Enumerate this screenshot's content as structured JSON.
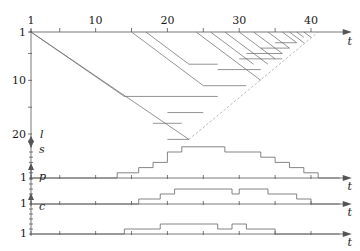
{
  "figure": {
    "title": "",
    "type": "multi-panel-timeline"
  },
  "main_panel": {
    "x_axis": {
      "label": "t",
      "tick_labels": [
        "1",
        "10",
        "20",
        "30",
        "40"
      ],
      "tick_values": [
        1,
        10,
        20,
        30,
        40
      ],
      "minor_tick_values": [
        1,
        5,
        10,
        15,
        20,
        25,
        30,
        35,
        40
      ],
      "range": [
        0,
        44
      ],
      "position": "top",
      "direction": "right"
    },
    "y_axis": {
      "label": "l",
      "tick_labels": [
        "1",
        "10",
        "20"
      ],
      "tick_values": [
        1,
        10,
        20
      ],
      "minor_tick_values": [
        1,
        5,
        10,
        15,
        20
      ],
      "range": [
        0,
        21
      ],
      "direction": "down"
    }
  },
  "sub_panels": [
    {
      "label": "s",
      "x_label": "t",
      "y_tick_label": "1"
    },
    {
      "label": "p",
      "x_label": "t",
      "y_tick_label": "1"
    },
    {
      "label": "c",
      "x_label": "t",
      "y_tick_label": "1"
    }
  ],
  "colors": {
    "axis": "#555555",
    "line": "#666666",
    "dashed": "#999999",
    "text": "#1a1a1a"
  },
  "chart_data": {
    "type": "line",
    "title": "",
    "xlabel": "t",
    "ylabel": "l",
    "xlim": [
      0,
      44
    ],
    "ylim": [
      0,
      21
    ],
    "grid": false,
    "legend": "none",
    "main_diagonals_down": [
      {
        "t0": 1,
        "l0": 1,
        "t1": 23,
        "l1": 21
      },
      {
        "t0": 1,
        "l0": 1,
        "t1": 14,
        "l1": 13
      },
      {
        "t0": 15,
        "l0": 1,
        "t1": 25,
        "l1": 11
      },
      {
        "t0": 17,
        "l0": 1,
        "t1": 23,
        "l1": 7
      },
      {
        "t0": 24,
        "l0": 1,
        "t1": 33,
        "l1": 10
      },
      {
        "t0": 26,
        "l0": 1,
        "t1": 32,
        "l1": 7
      },
      {
        "t0": 28,
        "l0": 1,
        "t1": 34,
        "l1": 7
      },
      {
        "t0": 30,
        "l0": 1,
        "t1": 35,
        "l1": 6
      },
      {
        "t0": 32,
        "l0": 1,
        "t1": 36,
        "l1": 5
      },
      {
        "t0": 34,
        "l0": 1,
        "t1": 37,
        "l1": 4
      },
      {
        "t0": 36,
        "l0": 1,
        "t1": 38,
        "l1": 3
      },
      {
        "t0": 37,
        "l0": 1,
        "t1": 39,
        "l1": 3
      },
      {
        "t0": 38,
        "l0": 1,
        "t1": 39,
        "l1": 2
      },
      {
        "t0": 39,
        "l0": 1,
        "t1": 40,
        "l1": 2
      }
    ],
    "envelope_dashed": [
      {
        "t0": 23,
        "l0": 21,
        "t1": 41,
        "l1": 1
      }
    ],
    "horizontal_segments": [
      {
        "l": 13,
        "t0": 14,
        "t1": 27
      },
      {
        "l": 21,
        "t0": 20,
        "t1": 23
      },
      {
        "l": 18,
        "t0": 18,
        "t1": 22
      },
      {
        "l": 16,
        "t0": 20,
        "t1": 25
      },
      {
        "l": 11,
        "t0": 25,
        "t1": 31
      },
      {
        "l": 8,
        "t0": 27,
        "t1": 33
      },
      {
        "l": 7,
        "t0": 23,
        "t1": 27
      },
      {
        "l": 6,
        "t0": 30,
        "t1": 36
      },
      {
        "l": 5,
        "t0": 31,
        "t1": 36
      },
      {
        "l": 4,
        "t0": 33,
        "t1": 37
      },
      {
        "l": 3,
        "t0": 35,
        "t1": 38
      }
    ],
    "panel_s": {
      "name": "s",
      "steps": [
        {
          "t": 1,
          "v": 0
        },
        {
          "t": 13,
          "v": 0
        },
        {
          "t": 13,
          "v": 1
        },
        {
          "t": 16,
          "v": 1
        },
        {
          "t": 16,
          "v": 2
        },
        {
          "t": 18,
          "v": 2
        },
        {
          "t": 18,
          "v": 3
        },
        {
          "t": 20,
          "v": 3
        },
        {
          "t": 20,
          "v": 5
        },
        {
          "t": 22,
          "v": 5
        },
        {
          "t": 22,
          "v": 6
        },
        {
          "t": 28,
          "v": 6
        },
        {
          "t": 28,
          "v": 5
        },
        {
          "t": 33,
          "v": 5
        },
        {
          "t": 33,
          "v": 4
        },
        {
          "t": 35,
          "v": 4
        },
        {
          "t": 35,
          "v": 3
        },
        {
          "t": 37,
          "v": 3
        },
        {
          "t": 37,
          "v": 2
        },
        {
          "t": 39,
          "v": 2
        },
        {
          "t": 39,
          "v": 1
        },
        {
          "t": 41,
          "v": 1
        },
        {
          "t": 41,
          "v": 0
        },
        {
          "t": 44,
          "v": 0
        }
      ]
    },
    "panel_p": {
      "name": "p",
      "steps": [
        {
          "t": 1,
          "v": 0
        },
        {
          "t": 16,
          "v": 0
        },
        {
          "t": 16,
          "v": 1
        },
        {
          "t": 19,
          "v": 1
        },
        {
          "t": 19,
          "v": 2
        },
        {
          "t": 21,
          "v": 2
        },
        {
          "t": 21,
          "v": 3
        },
        {
          "t": 29,
          "v": 3
        },
        {
          "t": 29,
          "v": 2
        },
        {
          "t": 30,
          "v": 2
        },
        {
          "t": 30,
          "v": 3
        },
        {
          "t": 34,
          "v": 3
        },
        {
          "t": 34,
          "v": 2
        },
        {
          "t": 38,
          "v": 2
        },
        {
          "t": 38,
          "v": 1
        },
        {
          "t": 40,
          "v": 1
        },
        {
          "t": 40,
          "v": 0
        },
        {
          "t": 44,
          "v": 0
        }
      ]
    },
    "panel_c": {
      "name": "c",
      "steps": [
        {
          "t": 1,
          "v": 0
        },
        {
          "t": 14,
          "v": 0
        },
        {
          "t": 14,
          "v": 1
        },
        {
          "t": 19,
          "v": 1
        },
        {
          "t": 19,
          "v": 2
        },
        {
          "t": 27,
          "v": 2
        },
        {
          "t": 27,
          "v": 1
        },
        {
          "t": 29,
          "v": 1
        },
        {
          "t": 29,
          "v": 2
        },
        {
          "t": 31,
          "v": 2
        },
        {
          "t": 31,
          "v": 1
        },
        {
          "t": 35,
          "v": 1
        },
        {
          "t": 35,
          "v": 0
        },
        {
          "t": 44,
          "v": 0
        }
      ]
    }
  }
}
